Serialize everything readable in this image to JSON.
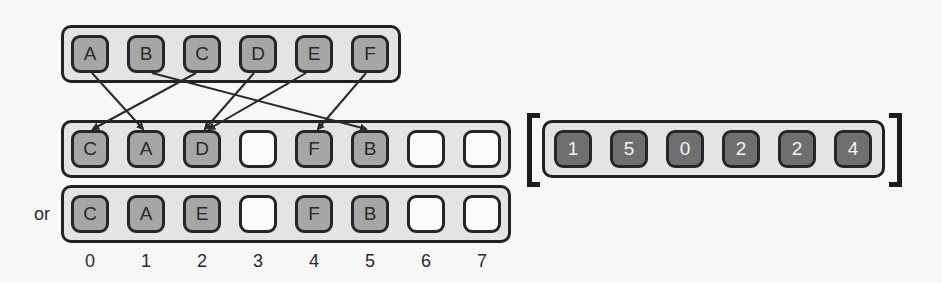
{
  "diagram": {
    "source_row": {
      "items": [
        "A",
        "B",
        "C",
        "D",
        "E",
        "F"
      ]
    },
    "mapping": [
      {
        "from": "A",
        "from_index": 0,
        "to_index": 1
      },
      {
        "from": "B",
        "from_index": 1,
        "to_index": 5
      },
      {
        "from": "C",
        "from_index": 2,
        "to_index": 0
      },
      {
        "from": "D",
        "from_index": 3,
        "to_index": 2
      },
      {
        "from": "E",
        "from_index": 4,
        "to_index": 2
      },
      {
        "from": "F",
        "from_index": 5,
        "to_index": 4
      }
    ],
    "table_option_1": {
      "slots": [
        "C",
        "A",
        "D",
        "",
        "F",
        "B",
        "",
        ""
      ]
    },
    "or_label": "or",
    "table_option_2": {
      "slots": [
        "C",
        "A",
        "E",
        "",
        "F",
        "B",
        "",
        ""
      ]
    },
    "indices": [
      "0",
      "1",
      "2",
      "3",
      "4",
      "5",
      "6",
      "7"
    ],
    "hash_values": {
      "values": [
        "1",
        "5",
        "0",
        "2",
        "2",
        "4"
      ]
    },
    "colors": {
      "filled_slot": "#a6a6a6",
      "empty_slot": "#fbfbfb",
      "dark_slot": "#6f6f6f",
      "container": "#e4e4e4",
      "border": "#222222"
    }
  }
}
